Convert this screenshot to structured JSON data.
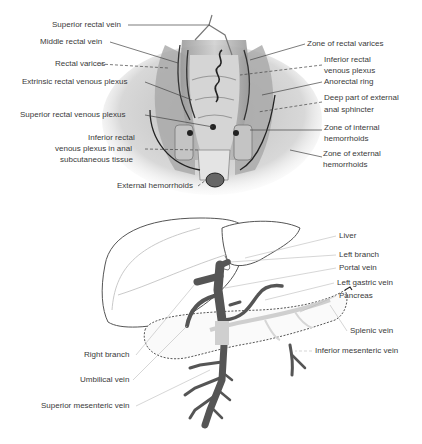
{
  "figure_top": {
    "name": "rectal-venous-anatomy",
    "left_labels": [
      {
        "text": "Superior rectal vein",
        "x": 52,
        "y": 21
      },
      {
        "text": "Middle rectal vein",
        "x": 40,
        "y": 38
      },
      {
        "text": "Rectal varices",
        "x": 55,
        "y": 60
      },
      {
        "text": "Extrinsic rectal venous plexus",
        "x": 22,
        "y": 78
      },
      {
        "text": "Superior rectal venous plexus",
        "x": 20,
        "y": 111
      },
      {
        "text": "Inferior rectal",
        "x": 88,
        "y": 134
      },
      {
        "text": "venous plexus in anal",
        "x": 55,
        "y": 145
      },
      {
        "text": "subcutaneous tissue",
        "x": 60,
        "y": 156
      },
      {
        "text": "External hemorrhoids",
        "x": 117,
        "y": 182
      }
    ],
    "right_labels": [
      {
        "text": "Zone of rectal varices",
        "x": 307,
        "y": 40
      },
      {
        "text": "Inferior rectal",
        "x": 324,
        "y": 56
      },
      {
        "text": "venous plexus",
        "x": 324,
        "y": 67
      },
      {
        "text": "Anorectal ring",
        "x": 324,
        "y": 78
      },
      {
        "text": "Deep part of external",
        "x": 324,
        "y": 94
      },
      {
        "text": "anal sphincter",
        "x": 324,
        "y": 106
      },
      {
        "text": "Zone of internal",
        "x": 324,
        "y": 124
      },
      {
        "text": "hemorrhoids",
        "x": 324,
        "y": 135
      },
      {
        "text": "Zone of external",
        "x": 323,
        "y": 150
      },
      {
        "text": "hemorrhoids",
        "x": 323,
        "y": 161
      }
    ]
  },
  "figure_bottom": {
    "name": "portal-venous-system",
    "right_labels": [
      {
        "text": "Liver",
        "x": 339,
        "y": 232
      },
      {
        "text": "Left branch",
        "x": 339,
        "y": 251
      },
      {
        "text": "Portal vein",
        "x": 339,
        "y": 264
      },
      {
        "text": "Left gastric vein",
        "x": 337,
        "y": 279
      },
      {
        "text": "Pancreas",
        "x": 339,
        "y": 292
      },
      {
        "text": "Splenic vein",
        "x": 350,
        "y": 327
      },
      {
        "text": "Inferior mesenteric vein",
        "x": 315,
        "y": 347
      }
    ],
    "left_labels": [
      {
        "text": "Right branch",
        "x": 84,
        "y": 351
      },
      {
        "text": "Umbilical vein",
        "x": 80,
        "y": 376
      },
      {
        "text": "Superior mesenteric vein",
        "x": 41,
        "y": 402
      }
    ]
  },
  "colors": {
    "vein_dark": "#555555",
    "outline": "#444444",
    "tissue_gray": "#c8c8c8",
    "label_text": "#3a3a3a"
  }
}
